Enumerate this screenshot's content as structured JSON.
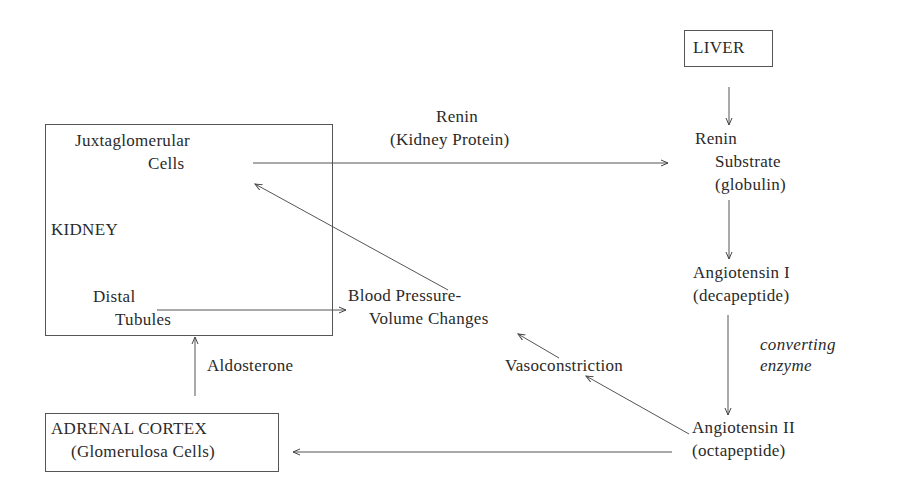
{
  "diagram": {
    "nodes": {
      "liver": {
        "label": "LIVER"
      },
      "kidney": {
        "label": "KIDNEY",
        "juxtaglomerular": {
          "line1": "Juxtaglomerular",
          "line2": "Cells"
        },
        "distal": {
          "line1": "Distal",
          "line2": "Tubules"
        }
      },
      "renin_substrate": {
        "line1": "Renin",
        "line2": "Substrate",
        "line3": "(globulin)"
      },
      "angiotensin_1": {
        "line1": "Angiotensin I",
        "line2": "(decapeptide)"
      },
      "angiotensin_2": {
        "line1": "Angiotensin II",
        "line2": "(octapeptide)"
      },
      "blood_pressure": {
        "line1": "Blood Pressure-",
        "line2": "Volume Changes"
      },
      "vasoconstriction": {
        "label": "Vasoconstriction"
      },
      "adrenal": {
        "line1": "ADRENAL CORTEX",
        "line2": "(Glomerulosa Cells)"
      }
    },
    "edge_labels": {
      "renin": {
        "line1": "Renin",
        "line2": "(Kidney Protein)"
      },
      "converting": {
        "line1": "converting",
        "line2": "enzyme"
      },
      "aldosterone": {
        "label": "Aldosterone"
      }
    },
    "edges": [
      {
        "from": "Juxtaglomerular Cells",
        "to": "Renin Substrate",
        "label": "Renin (Kidney Protein)"
      },
      {
        "from": "LIVER",
        "to": "Renin Substrate"
      },
      {
        "from": "Renin Substrate",
        "to": "Angiotensin I"
      },
      {
        "from": "Angiotensin I",
        "to": "Angiotensin II",
        "label": "converting enzyme"
      },
      {
        "from": "Angiotensin II",
        "to": "Vasoconstriction"
      },
      {
        "from": "Vasoconstriction",
        "to": "Blood Pressure-Volume Changes"
      },
      {
        "from": "Angiotensin II",
        "to": "ADRENAL CORTEX"
      },
      {
        "from": "ADRENAL CORTEX",
        "to": "Distal Tubules",
        "label": "Aldosterone"
      },
      {
        "from": "Distal Tubules",
        "to": "Blood Pressure-Volume Changes"
      },
      {
        "from": "Blood Pressure-Volume Changes",
        "to": "Juxtaglomerular Cells"
      }
    ]
  }
}
